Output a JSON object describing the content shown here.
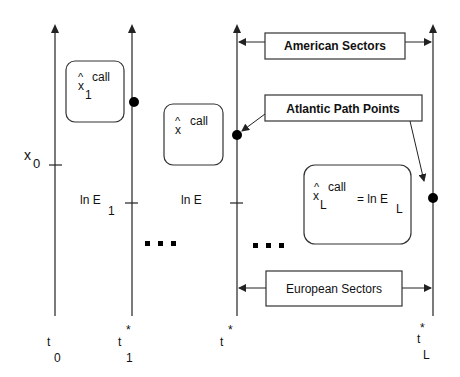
{
  "diagram": {
    "axes": [
      {
        "id": "t0",
        "x": 55,
        "time_label": "t",
        "time_sub": "0",
        "time_sup": ""
      },
      {
        "id": "t1star",
        "x": 132,
        "time_label": "t",
        "time_sub": "1",
        "time_sup": "*"
      },
      {
        "id": "tstar",
        "x": 237,
        "time_label": "t",
        "time_sub": "",
        "time_sup": "*"
      },
      {
        "id": "tLstar",
        "x": 433,
        "time_label": "t",
        "time_sub": "L",
        "time_sup": "*"
      }
    ],
    "state_labels": {
      "x0": {
        "base": "x",
        "sub": "0"
      },
      "lnE1": {
        "base": "ln E",
        "sub": "1"
      },
      "lnE": {
        "base": "ln E",
        "sub": ""
      }
    },
    "boxes": {
      "box1": {
        "hat": "^",
        "var": "x",
        "sub": "1",
        "sup": "call"
      },
      "box2": {
        "hat": "^",
        "var": "x",
        "sub": "",
        "sup": "call"
      },
      "boxL": {
        "hat": "^",
        "var": "x",
        "sub": "L",
        "sup": "call",
        "equals": "= ln E",
        "eq_sub": "L"
      }
    },
    "callouts": {
      "american": "American Sectors",
      "atlantic": "Atlantic Path Points",
      "european": "European Sectors"
    },
    "ellipsis": "▪ ▪ ▪",
    "path_points": [
      {
        "x": 134,
        "y": 102
      },
      {
        "x": 237,
        "y": 135
      },
      {
        "x": 433,
        "y": 198
      }
    ],
    "colors": {
      "line": "#222222",
      "box_stroke": "#333333",
      "background": "#ffffff"
    }
  }
}
